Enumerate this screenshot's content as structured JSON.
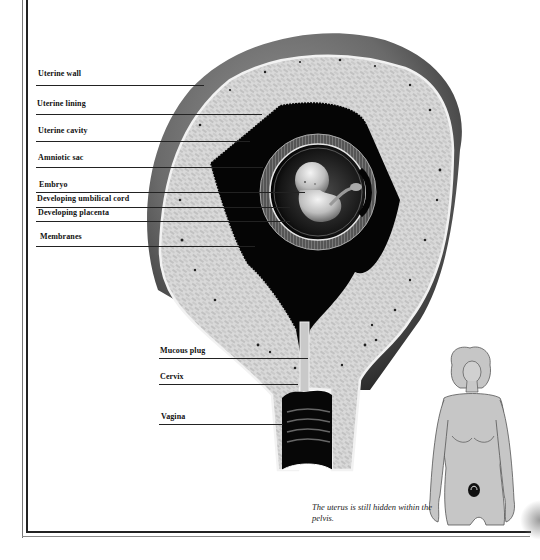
{
  "diagram": {
    "labels": [
      {
        "text": "Uterine wall",
        "x": 38,
        "y": 72,
        "line_x2": 204,
        "line_y": 85
      },
      {
        "text": "Uterine lining",
        "x": 37,
        "y": 101,
        "line_x2": 262,
        "line_y": 114
      },
      {
        "text": "Uterine cavity",
        "x": 38,
        "y": 128,
        "line_x2": 250,
        "line_y": 141
      },
      {
        "text": "Amniotic sac",
        "x": 38,
        "y": 155,
        "line_x2": 263,
        "line_y": 167
      },
      {
        "text": "Embryo",
        "x": 39,
        "y": 181,
        "line_x2": 305,
        "line_y": 192
      },
      {
        "text": "Developing umbilical cord",
        "x": 37,
        "y": 195,
        "line_x2": 290,
        "line_y": 207
      },
      {
        "text": "Developing placenta",
        "x": 38,
        "y": 209,
        "line_x2": 290,
        "line_y": 221
      },
      {
        "text": "Membranes",
        "x": 40,
        "y": 233,
        "line_x2": 255,
        "line_y": 246
      },
      {
        "text": "Mucous plug",
        "x": 160,
        "y": 348,
        "line_x2": 308,
        "line_y": 358
      },
      {
        "text": "Cervix",
        "x": 160,
        "y": 373,
        "line_x2": 298,
        "line_y": 384
      },
      {
        "text": "Vagina",
        "x": 161,
        "y": 413,
        "line_x2": 283,
        "line_y": 424
      }
    ],
    "inset": {
      "caption": "The uterus is still hidden within the pelvis.",
      "figure": "female-torso-with-uterus-location"
    }
  },
  "colors": {
    "ink": "#111111",
    "tissue": "#d6d6d6",
    "cavity": "#0a0a0a",
    "outer_wall": "#6e6e6e",
    "skin": "#c8c8c8",
    "background": "#ffffff"
  }
}
